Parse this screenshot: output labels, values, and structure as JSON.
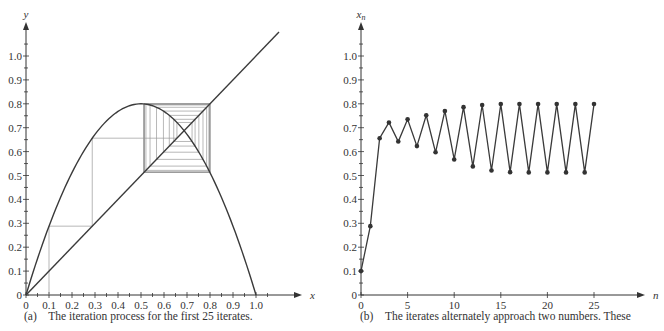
{
  "chart_data": [
    {
      "type": "line",
      "title": "",
      "caption": "(a) The iteration process for the first 25 iterates.",
      "xlabel": "x",
      "ylabel": "y",
      "xlim": [
        0,
        1.2
      ],
      "ylim": [
        0,
        1.15
      ],
      "x_ticks": [
        "0",
        "0.1",
        "0.2",
        "0.3",
        "0.4",
        "0.5",
        "0.6",
        "0.7",
        "0.8",
        "0.9",
        "1.0"
      ],
      "y_ticks": [
        "0",
        "0.1",
        "0.2",
        "0.3",
        "0.4",
        "0.5",
        "0.6",
        "0.7",
        "0.8",
        "0.9",
        "1.0"
      ],
      "grid": false,
      "series": [
        {
          "name": "f(x) = 3.2x(1 - x)",
          "kind": "parabola",
          "r": 3.2
        },
        {
          "name": "y = x",
          "kind": "diagonal"
        },
        {
          "name": "cobweb",
          "kind": "cobweb",
          "x0": 0.1,
          "iterations": 25
        }
      ]
    },
    {
      "type": "line",
      "title": "",
      "caption": "(b) The iterates alternately approach two numbers. These",
      "xlabel": "n",
      "ylabel": "x_n",
      "xlim": [
        0,
        30
      ],
      "ylim": [
        0,
        1.15
      ],
      "x_ticks": [
        "0",
        "5",
        "10",
        "15",
        "20",
        "25"
      ],
      "y_ticks": [
        "0",
        "0.1",
        "0.2",
        "0.3",
        "0.4",
        "0.5",
        "0.6",
        "0.7",
        "0.8",
        "0.9",
        "1.0"
      ],
      "grid": false,
      "x": [
        0,
        1,
        2,
        3,
        4,
        5,
        6,
        7,
        8,
        9,
        10,
        11,
        12,
        13,
        14,
        15,
        16,
        17,
        18,
        19,
        20,
        21,
        22,
        23,
        24,
        25
      ],
      "series": [
        {
          "name": "x_n",
          "values": [
            0.1,
            0.288,
            0.656,
            0.722,
            0.642,
            0.735,
            0.623,
            0.752,
            0.597,
            0.77,
            0.567,
            0.786,
            0.538,
            0.795,
            0.521,
            0.799,
            0.514,
            0.799,
            0.513,
            0.799,
            0.513,
            0.799,
            0.513,
            0.799,
            0.513,
            0.799
          ]
        }
      ]
    }
  ],
  "colors": {
    "axis": "#333333",
    "curve": "#3a3a3a",
    "cobweb": "#9a9a9a",
    "marker": "#333333"
  }
}
